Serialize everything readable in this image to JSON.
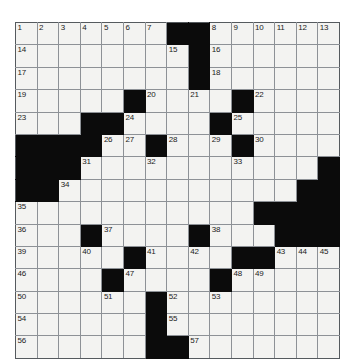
{
  "puzzle": {
    "kind": "crossword-grid",
    "columns": 14,
    "rows": 15,
    "colors": {
      "block": "#0b0b0b",
      "cell": "#f3f3f1",
      "grid_line": "#8d9196",
      "border": "#555a5e",
      "number_text": "#1b1b1b",
      "page_background": "#ffffff"
    },
    "cells": [
      [
        {
          "block": false,
          "number": "1"
        },
        {
          "block": false,
          "number": "2"
        },
        {
          "block": false,
          "number": "3"
        },
        {
          "block": false,
          "number": "4"
        },
        {
          "block": false,
          "number": "5"
        },
        {
          "block": false,
          "number": "6"
        },
        {
          "block": false,
          "number": "7"
        },
        {
          "block": true,
          "number": ""
        },
        {
          "block": true,
          "number": ""
        },
        {
          "block": false,
          "number": "8"
        },
        {
          "block": false,
          "number": "9"
        },
        {
          "block": false,
          "number": "10"
        },
        {
          "block": false,
          "number": "11"
        },
        {
          "block": false,
          "number": "12"
        },
        {
          "block": false,
          "number": "13"
        }
      ],
      [
        {
          "block": false,
          "number": "14"
        },
        {
          "block": false,
          "number": ""
        },
        {
          "block": false,
          "number": ""
        },
        {
          "block": false,
          "number": ""
        },
        {
          "block": false,
          "number": ""
        },
        {
          "block": false,
          "number": ""
        },
        {
          "block": false,
          "number": ""
        },
        {
          "block": false,
          "number": "15"
        },
        {
          "block": true,
          "number": ""
        },
        {
          "block": false,
          "number": "16"
        },
        {
          "block": false,
          "number": ""
        },
        {
          "block": false,
          "number": ""
        },
        {
          "block": false,
          "number": ""
        },
        {
          "block": false,
          "number": ""
        },
        {
          "block": false,
          "number": ""
        }
      ],
      [
        {
          "block": false,
          "number": "17"
        },
        {
          "block": false,
          "number": ""
        },
        {
          "block": false,
          "number": ""
        },
        {
          "block": false,
          "number": ""
        },
        {
          "block": false,
          "number": ""
        },
        {
          "block": false,
          "number": ""
        },
        {
          "block": false,
          "number": ""
        },
        {
          "block": false,
          "number": ""
        },
        {
          "block": true,
          "number": ""
        },
        {
          "block": false,
          "number": "18"
        },
        {
          "block": false,
          "number": ""
        },
        {
          "block": false,
          "number": ""
        },
        {
          "block": false,
          "number": ""
        },
        {
          "block": false,
          "number": ""
        },
        {
          "block": false,
          "number": ""
        }
      ],
      [
        {
          "block": false,
          "number": "19"
        },
        {
          "block": false,
          "number": ""
        },
        {
          "block": false,
          "number": ""
        },
        {
          "block": false,
          "number": ""
        },
        {
          "block": false,
          "number": ""
        },
        {
          "block": true,
          "number": ""
        },
        {
          "block": false,
          "number": "20"
        },
        {
          "block": false,
          "number": ""
        },
        {
          "block": false,
          "number": "21"
        },
        {
          "block": false,
          "number": ""
        },
        {
          "block": true,
          "number": ""
        },
        {
          "block": false,
          "number": "22"
        },
        {
          "block": false,
          "number": ""
        },
        {
          "block": false,
          "number": ""
        },
        {
          "block": false,
          "number": ""
        }
      ],
      [
        {
          "block": false,
          "number": "23"
        },
        {
          "block": false,
          "number": ""
        },
        {
          "block": false,
          "number": ""
        },
        {
          "block": true,
          "number": ""
        },
        {
          "block": true,
          "number": ""
        },
        {
          "block": false,
          "number": "24"
        },
        {
          "block": false,
          "number": ""
        },
        {
          "block": false,
          "number": ""
        },
        {
          "block": false,
          "number": ""
        },
        {
          "block": true,
          "number": ""
        },
        {
          "block": false,
          "number": "25"
        },
        {
          "block": false,
          "number": ""
        },
        {
          "block": false,
          "number": ""
        },
        {
          "block": false,
          "number": ""
        },
        {
          "block": false,
          "number": ""
        }
      ],
      [
        {
          "block": true,
          "number": ""
        },
        {
          "block": true,
          "number": ""
        },
        {
          "block": true,
          "number": ""
        },
        {
          "block": true,
          "number": ""
        },
        {
          "block": false,
          "number": "26"
        },
        {
          "block": false,
          "number": "27"
        },
        {
          "block": true,
          "number": ""
        },
        {
          "block": false,
          "number": "28"
        },
        {
          "block": false,
          "number": ""
        },
        {
          "block": false,
          "number": "29"
        },
        {
          "block": true,
          "number": ""
        },
        {
          "block": false,
          "number": "30"
        },
        {
          "block": false,
          "number": ""
        },
        {
          "block": false,
          "number": ""
        },
        {
          "block": false,
          "number": ""
        }
      ],
      [
        {
          "block": true,
          "number": ""
        },
        {
          "block": true,
          "number": ""
        },
        {
          "block": true,
          "number": ""
        },
        {
          "block": false,
          "number": "31"
        },
        {
          "block": false,
          "number": ""
        },
        {
          "block": false,
          "number": ""
        },
        {
          "block": false,
          "number": "32"
        },
        {
          "block": false,
          "number": ""
        },
        {
          "block": false,
          "number": ""
        },
        {
          "block": false,
          "number": ""
        },
        {
          "block": false,
          "number": "33"
        },
        {
          "block": false,
          "number": ""
        },
        {
          "block": false,
          "number": ""
        },
        {
          "block": false,
          "number": ""
        },
        {
          "block": true,
          "number": ""
        }
      ],
      [
        {
          "block": true,
          "number": ""
        },
        {
          "block": true,
          "number": ""
        },
        {
          "block": false,
          "number": "34"
        },
        {
          "block": false,
          "number": ""
        },
        {
          "block": false,
          "number": ""
        },
        {
          "block": false,
          "number": ""
        },
        {
          "block": false,
          "number": ""
        },
        {
          "block": false,
          "number": ""
        },
        {
          "block": false,
          "number": ""
        },
        {
          "block": false,
          "number": ""
        },
        {
          "block": false,
          "number": ""
        },
        {
          "block": false,
          "number": ""
        },
        {
          "block": false,
          "number": ""
        },
        {
          "block": true,
          "number": ""
        },
        {
          "block": true,
          "number": ""
        }
      ],
      [
        {
          "block": false,
          "number": "35"
        },
        {
          "block": false,
          "number": ""
        },
        {
          "block": false,
          "number": ""
        },
        {
          "block": false,
          "number": ""
        },
        {
          "block": false,
          "number": ""
        },
        {
          "block": false,
          "number": ""
        },
        {
          "block": false,
          "number": ""
        },
        {
          "block": false,
          "number": ""
        },
        {
          "block": false,
          "number": ""
        },
        {
          "block": false,
          "number": ""
        },
        {
          "block": false,
          "number": ""
        },
        {
          "block": true,
          "number": ""
        },
        {
          "block": true,
          "number": ""
        },
        {
          "block": true,
          "number": ""
        },
        {
          "block": true,
          "number": ""
        }
      ],
      [
        {
          "block": false,
          "number": "36"
        },
        {
          "block": false,
          "number": ""
        },
        {
          "block": false,
          "number": ""
        },
        {
          "block": true,
          "number": ""
        },
        {
          "block": false,
          "number": "37"
        },
        {
          "block": false,
          "number": ""
        },
        {
          "block": false,
          "number": ""
        },
        {
          "block": false,
          "number": ""
        },
        {
          "block": true,
          "number": ""
        },
        {
          "block": false,
          "number": "38"
        },
        {
          "block": false,
          "number": ""
        },
        {
          "block": false,
          "number": ""
        },
        {
          "block": true,
          "number": ""
        },
        {
          "block": true,
          "number": ""
        },
        {
          "block": true,
          "number": ""
        }
      ],
      [
        {
          "block": false,
          "number": "39"
        },
        {
          "block": false,
          "number": ""
        },
        {
          "block": false,
          "number": ""
        },
        {
          "block": false,
          "number": "40"
        },
        {
          "block": false,
          "number": ""
        },
        {
          "block": true,
          "number": ""
        },
        {
          "block": false,
          "number": "41"
        },
        {
          "block": false,
          "number": ""
        },
        {
          "block": false,
          "number": "42"
        },
        {
          "block": false,
          "number": ""
        },
        {
          "block": true,
          "number": ""
        },
        {
          "block": true,
          "number": ""
        },
        {
          "block": false,
          "number": "43"
        },
        {
          "block": false,
          "number": "44"
        },
        {
          "block": false,
          "number": "45"
        }
      ],
      [
        {
          "block": false,
          "number": "46"
        },
        {
          "block": false,
          "number": ""
        },
        {
          "block": false,
          "number": ""
        },
        {
          "block": false,
          "number": ""
        },
        {
          "block": true,
          "number": ""
        },
        {
          "block": false,
          "number": "47"
        },
        {
          "block": false,
          "number": ""
        },
        {
          "block": false,
          "number": ""
        },
        {
          "block": false,
          "number": ""
        },
        {
          "block": true,
          "number": ""
        },
        {
          "block": false,
          "number": "48"
        },
        {
          "block": false,
          "number": "49"
        },
        {
          "block": false,
          "number": ""
        },
        {
          "block": false,
          "number": ""
        },
        {
          "block": false,
          "number": ""
        }
      ],
      [
        {
          "block": false,
          "number": "50"
        },
        {
          "block": false,
          "number": ""
        },
        {
          "block": false,
          "number": ""
        },
        {
          "block": false,
          "number": ""
        },
        {
          "block": false,
          "number": "51"
        },
        {
          "block": false,
          "number": ""
        },
        {
          "block": true,
          "number": ""
        },
        {
          "block": false,
          "number": "52"
        },
        {
          "block": false,
          "number": ""
        },
        {
          "block": false,
          "number": "53"
        },
        {
          "block": false,
          "number": ""
        },
        {
          "block": false,
          "number": ""
        },
        {
          "block": false,
          "number": ""
        },
        {
          "block": false,
          "number": ""
        },
        {
          "block": false,
          "number": ""
        }
      ],
      [
        {
          "block": false,
          "number": "54"
        },
        {
          "block": false,
          "number": ""
        },
        {
          "block": false,
          "number": ""
        },
        {
          "block": false,
          "number": ""
        },
        {
          "block": false,
          "number": ""
        },
        {
          "block": false,
          "number": ""
        },
        {
          "block": true,
          "number": ""
        },
        {
          "block": false,
          "number": "55"
        },
        {
          "block": false,
          "number": ""
        },
        {
          "block": false,
          "number": ""
        },
        {
          "block": false,
          "number": ""
        },
        {
          "block": false,
          "number": ""
        },
        {
          "block": false,
          "number": ""
        },
        {
          "block": false,
          "number": ""
        },
        {
          "block": false,
          "number": ""
        }
      ],
      [
        {
          "block": false,
          "number": "56"
        },
        {
          "block": false,
          "number": ""
        },
        {
          "block": false,
          "number": ""
        },
        {
          "block": false,
          "number": ""
        },
        {
          "block": false,
          "number": ""
        },
        {
          "block": false,
          "number": ""
        },
        {
          "block": true,
          "number": ""
        },
        {
          "block": true,
          "number": ""
        },
        {
          "block": false,
          "number": "57"
        },
        {
          "block": false,
          "number": ""
        },
        {
          "block": false,
          "number": ""
        },
        {
          "block": false,
          "number": ""
        },
        {
          "block": false,
          "number": ""
        },
        {
          "block": false,
          "number": ""
        },
        {
          "block": false,
          "number": ""
        }
      ]
    ]
  }
}
